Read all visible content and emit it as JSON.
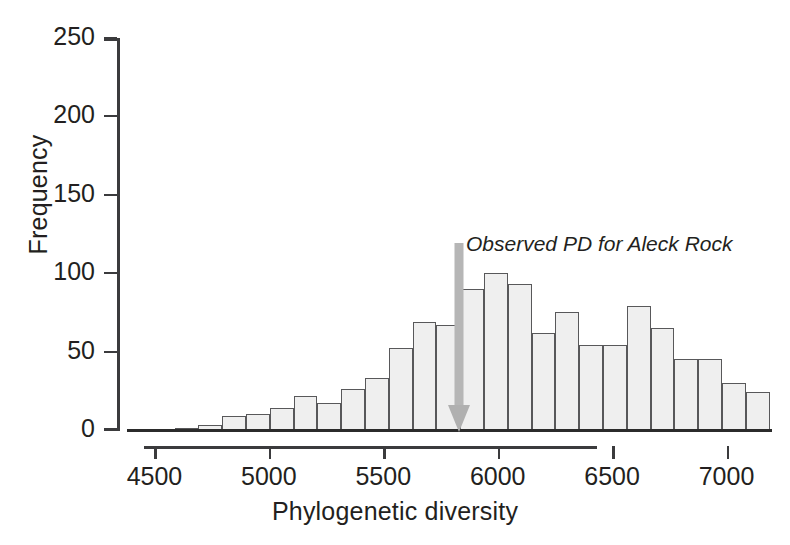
{
  "chart_data": {
    "type": "bar",
    "title": "",
    "subtitle": "",
    "xlabel": "Phylogenetic diversity",
    "ylabel": "Frequency",
    "xlim": [
      4380,
      7190
    ],
    "ylim": [
      0,
      250
    ],
    "grid": false,
    "legend": null,
    "x_ticks": [
      4500,
      5000,
      5500,
      6000,
      6500,
      7000
    ],
    "x_tick_labels": [
      "4500",
      "5000",
      "5500",
      "6000",
      "6500",
      "7000"
    ],
    "y_ticks": [
      0,
      50,
      100,
      150,
      200,
      250
    ],
    "y_tick_labels": [
      "0",
      "50",
      "100",
      "150",
      "200",
      "250"
    ],
    "bin_width": 104,
    "bin_starts": [
      4380,
      4484,
      4588,
      4692,
      4796,
      4900,
      5004,
      5108,
      5212,
      5316,
      5420,
      5524,
      5628,
      5732,
      5836,
      5940,
      6044,
      6148,
      6252,
      6356,
      6460,
      6564,
      6668,
      6772,
      6876,
      6980,
      7084
    ],
    "categories": [
      "4380",
      "4484",
      "4588",
      "4692",
      "4796",
      "4900",
      "5004",
      "5108",
      "5212",
      "5316",
      "5420",
      "5524",
      "5628",
      "5732",
      "5836",
      "5940",
      "6044",
      "6148",
      "6252",
      "6356",
      "6460",
      "6564",
      "6668",
      "6772",
      "6876",
      "6980",
      "7084"
    ],
    "values": [
      0,
      0,
      1,
      3,
      9,
      10,
      14,
      22,
      17,
      26,
      33,
      52,
      69,
      67,
      90,
      100,
      93,
      62,
      75,
      54,
      54,
      79,
      65,
      45,
      45,
      30,
      24
    ],
    "annotations": [
      {
        "name": "observed-pd-arrow",
        "text": "Observed PD for Aleck Rock",
        "x_value": 5845,
        "color": "#b0b0b0",
        "arrow_direction": "down"
      }
    ]
  },
  "axes": {
    "y": {
      "label": "Frequency",
      "ticks": [
        {
          "value": 250,
          "label": "250"
        },
        {
          "value": 200,
          "label": "200"
        },
        {
          "value": 150,
          "label": "150"
        },
        {
          "value": 100,
          "label": "100"
        },
        {
          "value": 50,
          "label": "50"
        },
        {
          "value": 0,
          "label": "0"
        }
      ]
    },
    "x": {
      "label": "Phylogenetic diversity",
      "ticks": [
        {
          "value": 4500,
          "label": "4500"
        },
        {
          "value": 5000,
          "label": "5000"
        },
        {
          "value": 5500,
          "label": "5500"
        },
        {
          "value": 6000,
          "label": "6000"
        },
        {
          "value": 6500,
          "label": "6500"
        },
        {
          "value": 7000,
          "label": "7000"
        }
      ]
    }
  },
  "annotation": {
    "observed_pd_text": "Observed PD for Aleck Rock"
  },
  "colors": {
    "bar_fill": "#efefef",
    "bar_stroke": "#58585a",
    "axis": "#3b3b3d",
    "text": "#231f20",
    "arrow": "#b0b0b0",
    "background": "#ffffff"
  }
}
